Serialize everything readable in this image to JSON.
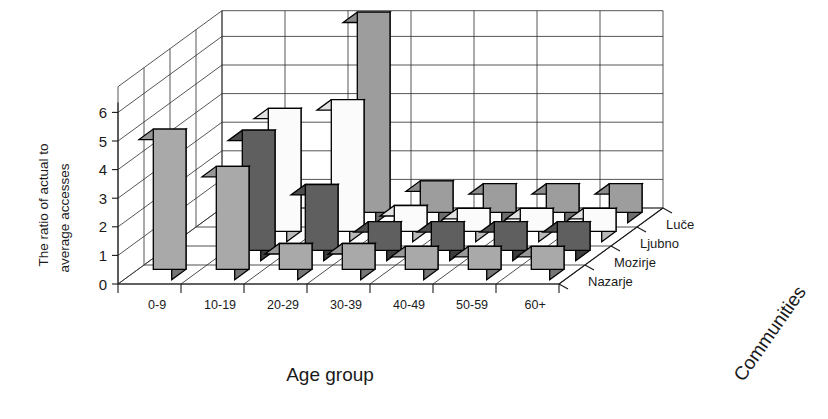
{
  "chart_data": {
    "type": "bar",
    "subtype": "3d-grouped-bar",
    "title": "",
    "xlabel": "Age group",
    "ylabel": "The ratio of actual to average accesses",
    "zlabel": "Communities",
    "ylim": [
      0,
      6
    ],
    "yticks": [
      0,
      1,
      2,
      3,
      4,
      5,
      6
    ],
    "grid": true,
    "legend_position": "depth-axis-right",
    "categories": [
      "0-9",
      "10-19",
      "20-29",
      "30-39",
      "40-49",
      "50-59",
      "60+"
    ],
    "series": [
      {
        "name": "Luce",
        "display_name": "Luče",
        "values": [
          0.0,
          0.0,
          7.0,
          1.1,
          1.0,
          1.0,
          1.0
        ]
      },
      {
        "name": "Ljubno",
        "display_name": "Ljubno",
        "values": [
          0.0,
          4.3,
          4.6,
          0.9,
          0.8,
          0.8,
          0.8
        ]
      },
      {
        "name": "Mozirje",
        "display_name": "Mozirje",
        "values": [
          0.0,
          4.2,
          2.3,
          1.0,
          1.0,
          1.0,
          1.0
        ]
      },
      {
        "name": "Nazarje",
        "display_name": "Nazarje",
        "values": [
          4.9,
          3.6,
          0.9,
          0.9,
          0.8,
          0.8,
          0.8
        ]
      }
    ],
    "series_colors_front": [
      "#9d9d9d",
      "#fbfbfb",
      "#5f5f5f",
      "#a9a9a9"
    ],
    "series_colors_side": [
      "#6e6e6e",
      "#b9b9b9",
      "#3d3d3d",
      "#767676"
    ],
    "series_colors_top": [
      "#8b8b8b",
      "#e2e2e2",
      "#4e4e4e",
      "#979797"
    ]
  },
  "axes": {
    "y_label_line1": "The ratio of actual to",
    "y_label_line2": "average accesses",
    "x_title": "Age group",
    "z_title": "Communities",
    "y_ticks": [
      "0",
      "1",
      "2",
      "3",
      "4",
      "5",
      "6"
    ],
    "x_ticks": [
      "0-9",
      "10-19",
      "20-29",
      "30-39",
      "40-49",
      "50-59",
      "60+"
    ],
    "z_ticks": [
      "Luče",
      "Ljubno",
      "Mozirje",
      "Nazarje"
    ]
  },
  "colors": {
    "background": "#ffffff",
    "ink": "#1a1a1a",
    "grid": "#2b2b2b"
  }
}
